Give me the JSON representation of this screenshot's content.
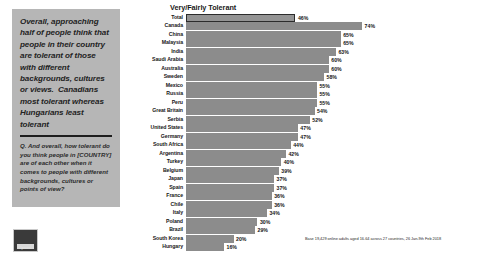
{
  "callout": {
    "headline": "Overall, approaching half of people think that people in their country are tolerant of those with different backgrounds, cultures or views.  Canadians most tolerant whereas Hungarians least tolerant",
    "question": "Q. And overall, how tolerant do you think people in [COUNTRY] are of each other when it comes to people with different backgrounds, cultures or points of view?"
  },
  "logo": {
    "name": "Ipsos"
  },
  "source_note": "Base 19,429 online adults aged 16-64 across 27 countries, 26 Jan-9th Feb 2018",
  "colors": {
    "bar": "#8c8c8c",
    "total_bar_border": "#2c2c2c",
    "panel_background": "#b6b6b6",
    "text": "#161616"
  },
  "chart_data": {
    "type": "bar",
    "title": "Very/Fairly Tolerant",
    "xlabel": "",
    "ylabel": "",
    "xlim": [
      0,
      100
    ],
    "grid": false,
    "legend": null,
    "orientation": "horizontal",
    "value_suffix": "%",
    "categories": [
      "Total",
      "Canada",
      "China",
      "Malaysia",
      "India",
      "Saudi Arabia",
      "Australia",
      "Sweden",
      "Mexico",
      "Russia",
      "Peru",
      "Great Britain",
      "Serbia",
      "United States",
      "Germany",
      "South Africa",
      "Argentina",
      "Turkey",
      "Belgium",
      "Japan",
      "Spain",
      "France",
      "Chile",
      "Italy",
      "Poland",
      "Brazil",
      "South Korea",
      "Hungary"
    ],
    "values": [
      46,
      74,
      65,
      65,
      63,
      60,
      60,
      58,
      55,
      55,
      55,
      54,
      52,
      47,
      47,
      44,
      42,
      40,
      39,
      37,
      37,
      36,
      36,
      34,
      30,
      29,
      20,
      16
    ],
    "labels": [
      "46%",
      "74%",
      "65%",
      "65%",
      "63%",
      "60%",
      "60%",
      "58%",
      "55%",
      "55%",
      "55%",
      "54%",
      "52%",
      "47%",
      "47%",
      "44%",
      "42%",
      "40%",
      "39%",
      "37%",
      "37%",
      "36%",
      "36%",
      "34%",
      "30%",
      "29%",
      "20%",
      "16%"
    ],
    "highlight_index": 0
  }
}
